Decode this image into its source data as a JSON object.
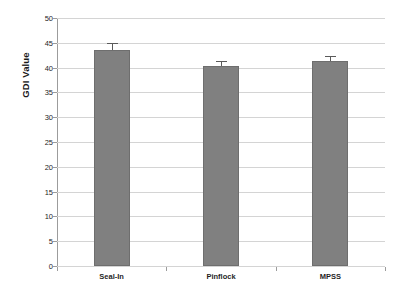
{
  "chart_data": {
    "type": "bar",
    "title": "",
    "xlabel": "",
    "ylabel": "GDI Value",
    "categories": [
      "Seal-In",
      "Pinflock",
      "MPSS"
    ],
    "values": [
      43.5,
      40.3,
      41.3
    ],
    "errors": [
      1.5,
      1.0,
      1.0
    ],
    "ylim": [
      0,
      50
    ],
    "ytick_step": 5,
    "ytick_labels": [
      "0",
      "5",
      "10",
      "15",
      "20",
      "25",
      "30",
      "35",
      "40",
      "45",
      "50"
    ],
    "grid": true,
    "legend": "none",
    "series": [
      {
        "name": "GDI Value",
        "values": [
          43.5,
          40.3,
          41.3
        ],
        "errors": [
          1.5,
          1.0,
          1.0
        ]
      }
    ],
    "colors": {
      "bar_fill": "#808080",
      "bar_border": "#6e6e6e",
      "gridline": "#d4d4d4",
      "axis": "#9c9c9c",
      "error_bar": "#5a5a5a",
      "background": "#ffffff",
      "text": "#1f1f1f"
    }
  }
}
